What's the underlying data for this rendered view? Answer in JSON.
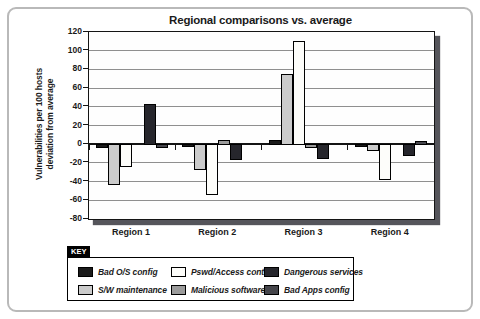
{
  "title": "Regional comparisons vs. average",
  "y_axis": {
    "label_line1": "Vulnerabilities per 100 hosts",
    "label_line2": "deviation from average",
    "ticks": [
      120,
      100,
      80,
      60,
      40,
      20,
      0,
      -20,
      -40,
      -60,
      -80
    ]
  },
  "x_axis": {
    "categories": [
      "Region 1",
      "Region 2",
      "Region 3",
      "Region 4"
    ]
  },
  "key": {
    "label": "KEY",
    "entries": [
      {
        "label": "Bad O/S config",
        "color": "#1b1b1b"
      },
      {
        "label": "Pswd/Access control",
        "color": "#fdfdfa"
      },
      {
        "label": "Dangerous services",
        "color": "#26262c"
      },
      {
        "label": "S/W maintenance",
        "color": "#cbcbcb"
      },
      {
        "label": "Malicious software",
        "color": "#9b9b9b"
      },
      {
        "label": "Bad Apps config",
        "color": "#46464c"
      }
    ]
  },
  "chart_data": {
    "type": "bar",
    "title": "Regional comparisons vs. average",
    "ylabel": "Vulnerabilities per 100 hosts deviation from average",
    "xlabel": "",
    "ylim": [
      -80,
      120
    ],
    "ytick_step": 20,
    "grid": true,
    "legend_position": "bottom",
    "categories": [
      "Region 1",
      "Region 2",
      "Region 3",
      "Region 4"
    ],
    "series": [
      {
        "name": "Bad O/S config",
        "color": "#1b1b1b",
        "values": [
          -3,
          -2,
          5,
          -2
        ]
      },
      {
        "name": "S/W maintenance",
        "color": "#cbcbcb",
        "values": [
          -43,
          -27,
          75,
          -6
        ]
      },
      {
        "name": "Pswd/Access control",
        "color": "#fdfdfa",
        "values": [
          -23,
          -53,
          110,
          -37
        ]
      },
      {
        "name": "Malicious software",
        "color": "#9b9b9b",
        "values": [
          0,
          4,
          -3,
          0
        ]
      },
      {
        "name": "Dangerous services",
        "color": "#26262c",
        "values": [
          43,
          -16,
          -15,
          -12
        ]
      },
      {
        "name": "Bad Apps config",
        "color": "#46464c",
        "values": [
          -3,
          0,
          0,
          3
        ]
      }
    ]
  }
}
